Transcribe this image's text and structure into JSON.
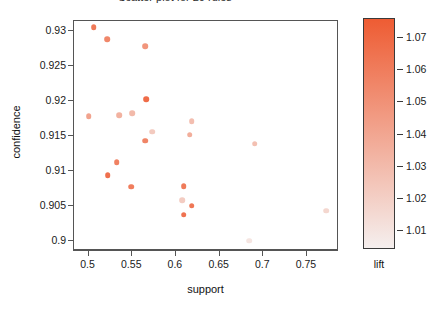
{
  "title": {
    "text": "Scatter plot for 20 rules",
    "visible": "clipped"
  },
  "axes": {
    "x_label": "support",
    "y_label": "confidence",
    "x_ticks": [
      "0.5",
      "0.55",
      "0.6",
      "0.65",
      "0.7",
      "0.75"
    ],
    "y_ticks": [
      "0.9",
      "0.905",
      "0.91",
      "0.915",
      "0.92",
      "0.925",
      "0.93"
    ]
  },
  "legend": {
    "title": "lift",
    "ticks": [
      "1.01",
      "1.02",
      "1.03",
      "1.04",
      "1.05",
      "1.06",
      "1.07"
    ],
    "low_color": "#f5efee",
    "high_color": "#ee5c33"
  },
  "chart_data": {
    "type": "scatter",
    "title": "Scatter plot for 20 rules",
    "xlabel": "support",
    "ylabel": "confidence",
    "xlim": [
      0.4833,
      0.7867
    ],
    "ylim": [
      0.8985,
      0.9315
    ],
    "grid": false,
    "legend_position": "right",
    "colorbar": {
      "label": "lift",
      "ticks": [
        1.01,
        1.02,
        1.03,
        1.04,
        1.05,
        1.06,
        1.07
      ],
      "vmin": 1.004,
      "vmax": 1.076,
      "low_color": "#f5efee",
      "high_color": "#ee5c33"
    },
    "point_fields": [
      "support",
      "confidence",
      "lift"
    ],
    "points": [
      {
        "support": 0.506,
        "confidence": 0.9306,
        "lift": 1.062
      },
      {
        "support": 0.521,
        "confidence": 0.9289,
        "lift": 1.055
      },
      {
        "support": 0.565,
        "confidence": 0.9279,
        "lift": 1.048
      },
      {
        "support": 0.566,
        "confidence": 0.9203,
        "lift": 1.068
      },
      {
        "support": 0.5,
        "confidence": 0.9178,
        "lift": 1.041
      },
      {
        "support": 0.535,
        "confidence": 0.918,
        "lift": 1.034
      },
      {
        "support": 0.55,
        "confidence": 0.9183,
        "lift": 1.03
      },
      {
        "support": 0.618,
        "confidence": 0.9171,
        "lift": 1.028
      },
      {
        "support": 0.573,
        "confidence": 0.9156,
        "lift": 1.022
      },
      {
        "support": 0.616,
        "confidence": 0.9152,
        "lift": 1.036
      },
      {
        "support": 0.565,
        "confidence": 0.9143,
        "lift": 1.056
      },
      {
        "support": 0.69,
        "confidence": 0.9139,
        "lift": 1.027
      },
      {
        "support": 0.532,
        "confidence": 0.9112,
        "lift": 1.058
      },
      {
        "support": 0.522,
        "confidence": 0.9094,
        "lift": 1.066
      },
      {
        "support": 0.549,
        "confidence": 0.9077,
        "lift": 1.06
      },
      {
        "support": 0.609,
        "confidence": 0.9078,
        "lift": 1.061
      },
      {
        "support": 0.607,
        "confidence": 0.9058,
        "lift": 1.021
      },
      {
        "support": 0.618,
        "confidence": 0.905,
        "lift": 1.063
      },
      {
        "support": 0.609,
        "confidence": 0.9037,
        "lift": 1.065
      },
      {
        "support": 0.684,
        "confidence": 0.9,
        "lift": 1.009
      },
      {
        "support": 0.772,
        "confidence": 0.9043,
        "lift": 1.016
      }
    ]
  }
}
